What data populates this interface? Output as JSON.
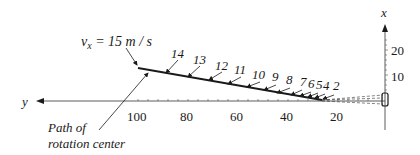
{
  "diagram": {
    "velocity_label": "v",
    "velocity_subscript": "x",
    "velocity_value": " = 15 m / s",
    "axis_y_label": "y",
    "axis_x_label": "x",
    "path_label_line1": "Path of",
    "path_label_line2": "rotation center",
    "y_ticks": [
      "100",
      "80",
      "60",
      "40",
      "20"
    ],
    "x_ticks": [
      "20",
      "10"
    ],
    "point_labels": [
      "14",
      "13",
      "12",
      "11",
      "10",
      "9",
      "8",
      "7",
      "6",
      "5",
      "4",
      "2"
    ],
    "colors": {
      "ink": "#1a1a1a",
      "axis": "#333333"
    }
  }
}
